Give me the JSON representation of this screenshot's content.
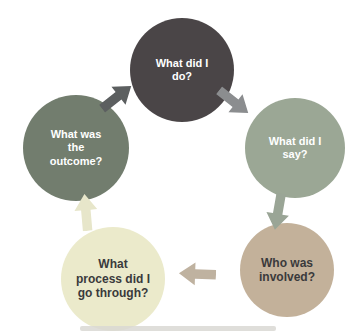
{
  "diagram": {
    "type": "cycle",
    "steps": [
      {
        "label": "What did I\ndo?",
        "position": "top",
        "circle_color": "#4a4547",
        "text_color": "#ffffff"
      },
      {
        "label": "What did I\nsay?",
        "position": "right",
        "circle_color": "#9ba795",
        "text_color": "#ffffff"
      },
      {
        "label": "Who was\ninvolved?",
        "position": "bottom-right",
        "circle_color": "#c3b19a",
        "text_color": "#3a3a3c"
      },
      {
        "label": "What\nprocess did I\ngo through?",
        "position": "bottom-left",
        "circle_color": "#ebeacb",
        "text_color": "#3a3a3c"
      },
      {
        "label": "What was\nthe\noutcome?",
        "position": "left",
        "circle_color": "#727d6e",
        "text_color": "#ffffff"
      }
    ],
    "arrows": [
      {
        "from": "What was the outcome?",
        "to": "What did I do?",
        "direction": "up-right",
        "color": "#5c5f60"
      },
      {
        "from": "What did I do?",
        "to": "What did I say?",
        "direction": "down-right",
        "color": "#8b8d8f"
      },
      {
        "from": "What did I say?",
        "to": "Who was involved?",
        "direction": "down",
        "color": "#9aa596"
      },
      {
        "from": "Who was involved?",
        "to": "What process did I go through?",
        "direction": "left",
        "color": "#bfb2a0"
      },
      {
        "from": "What process did I go through?",
        "to": "What was the outcome?",
        "direction": "up",
        "color": "#e7e6ca"
      }
    ]
  }
}
